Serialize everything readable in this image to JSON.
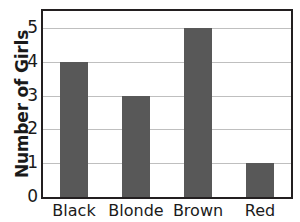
{
  "chart_data": {
    "type": "bar",
    "title": "",
    "xlabel": "",
    "ylabel": "Number of Girls",
    "categories": [
      "Black",
      "Blonde",
      "Brown",
      "Red"
    ],
    "values": [
      4,
      3,
      5,
      1
    ],
    "ylim": [
      0,
      5.5
    ],
    "yticks": [
      0,
      1,
      2,
      3,
      4,
      5
    ],
    "ytick_labels": [
      "0",
      "1",
      "2",
      "3",
      "4",
      "5"
    ],
    "grid": true,
    "grid_axis": "y",
    "legend": false,
    "legend_position": "none",
    "bar_color": "#585858",
    "grid_color": "#bfbfbf",
    "frame_color": "#231f20",
    "background_color": "#ffffff",
    "text_color": "#1a1a1a"
  }
}
